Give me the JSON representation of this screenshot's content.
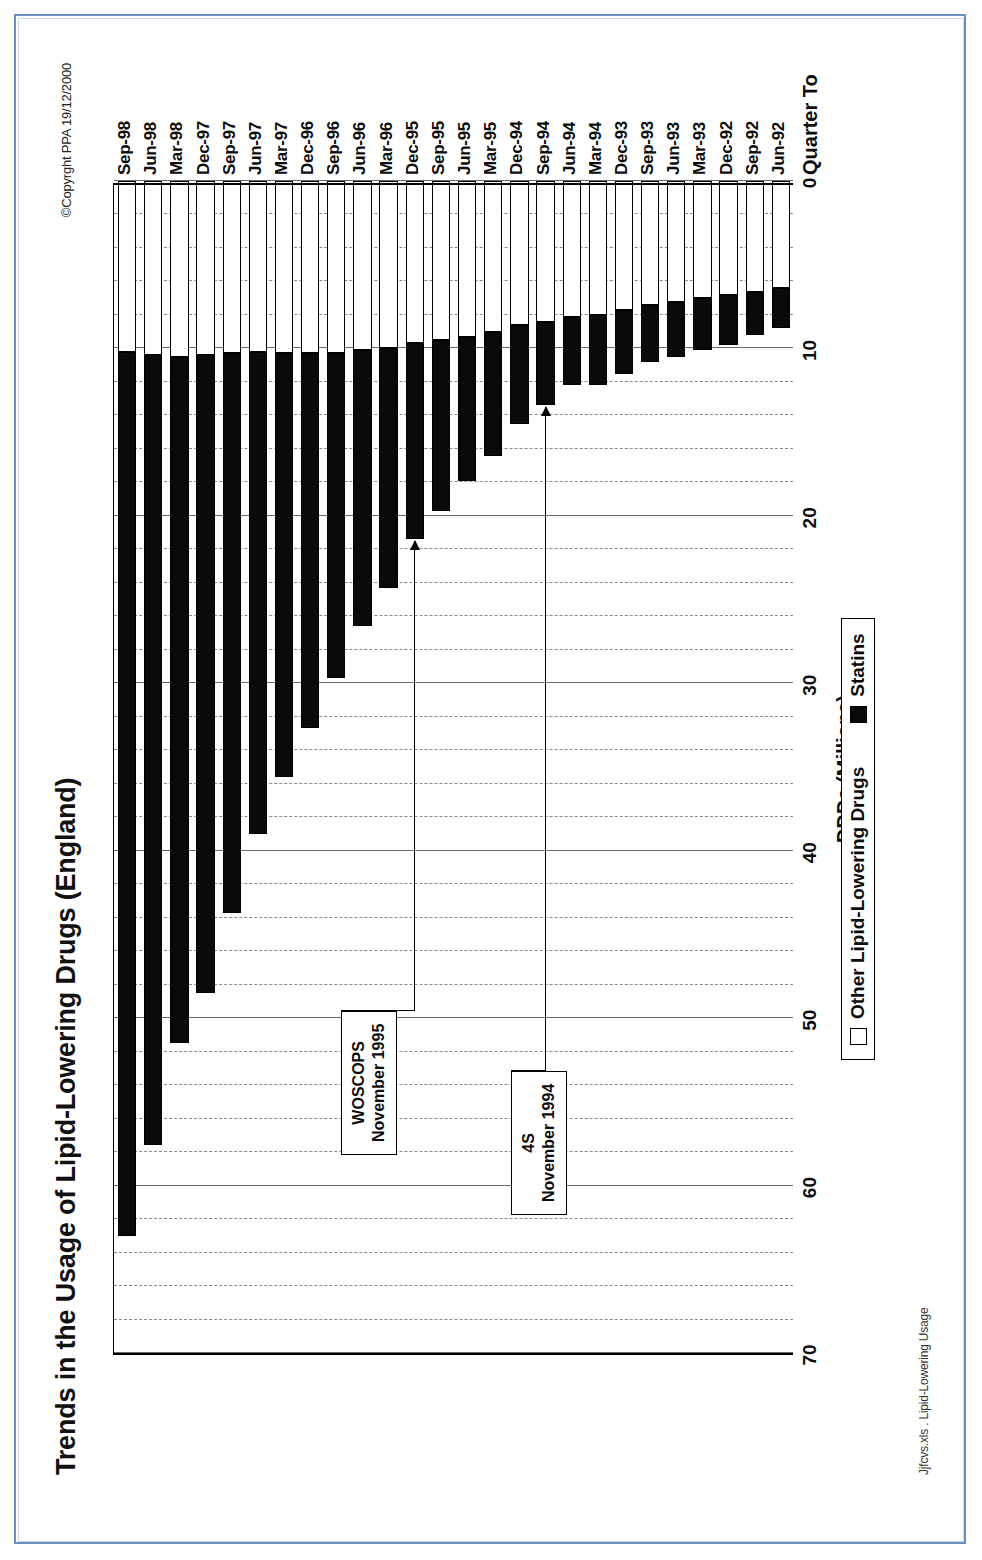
{
  "document": {
    "title": "Trends in the Usage of Lipid-Lowering Drugs (England)",
    "copyright": "©Copyrght PPA 19/12/2000",
    "filename": "Jjfcvs.xls . Lipid-Lowering Usage"
  },
  "legend": {
    "other_label": "Other Lipid-Lowering Drugs",
    "statins_label": "Statins"
  },
  "annotations": [
    {
      "id": "woscops",
      "line1": "WOSCOPS",
      "line2": "November 1995",
      "points_to": "Dec-95"
    },
    {
      "id": "4s",
      "line1": "4S",
      "line2": "November 1994",
      "points_to": "Sep-94"
    }
  ],
  "axes": {
    "value_title": "DDDs (Millions)",
    "category_title": "Quarter To",
    "value_ticks": [
      0,
      10,
      20,
      30,
      40,
      50,
      60,
      70
    ],
    "value_min": 0,
    "value_max": 70,
    "value_reversed": true,
    "minor_ticks_per_major": 5
  },
  "colors": {
    "statins": "#0a0a0a",
    "other": "#ffffff",
    "axis": "#000000",
    "grid": "#8a8a8a",
    "page_border": "#6d8fc0"
  },
  "chart_data": {
    "type": "bar",
    "orientation": "horizontal-stacked",
    "title": "Trends in the Usage of Lipid-Lowering Drugs (England)",
    "xlabel": "DDDs (Millions)",
    "ylabel": "Quarter To",
    "xlim": [
      0,
      70
    ],
    "x_reversed": true,
    "grid": true,
    "legend_position": "bottom",
    "categories": [
      "Sep-98",
      "Jun-98",
      "Mar-98",
      "Dec-97",
      "Sep-97",
      "Jun-97",
      "Mar-97",
      "Dec-96",
      "Sep-96",
      "Jun-96",
      "Mar-96",
      "Dec-95",
      "Sep-95",
      "Jun-95",
      "Mar-95",
      "Dec-94",
      "Sep-94",
      "Jun-94",
      "Mar-94",
      "Dec-93",
      "Sep-93",
      "Jun-93",
      "Mar-93",
      "Dec-92",
      "Sep-92",
      "Jun-92"
    ],
    "series": [
      {
        "name": "Other Lipid-Lowering Drugs",
        "values": [
          10.2,
          10.4,
          10.5,
          10.4,
          10.3,
          10.2,
          10.3,
          10.3,
          10.3,
          10.1,
          10.0,
          9.7,
          9.5,
          9.3,
          9.0,
          8.6,
          8.4,
          8.1,
          8.0,
          7.7,
          7.4,
          7.2,
          7.0,
          6.8,
          6.6,
          6.4
        ]
      },
      {
        "name": "Statins",
        "values": [
          52.8,
          47.2,
          41.0,
          38.1,
          33.4,
          28.8,
          25.3,
          22.4,
          19.4,
          16.5,
          14.3,
          11.7,
          10.2,
          8.6,
          7.4,
          5.9,
          5.0,
          4.1,
          4.2,
          3.8,
          3.4,
          3.3,
          3.1,
          3.0,
          2.6,
          2.4
        ]
      }
    ],
    "totals": [
      63.0,
      57.6,
      51.5,
      48.5,
      43.7,
      39.0,
      35.6,
      32.7,
      29.7,
      26.6,
      24.3,
      21.4,
      19.7,
      17.9,
      16.4,
      14.5,
      13.4,
      12.2,
      12.2,
      11.5,
      10.8,
      10.5,
      10.1,
      9.8,
      9.2,
      8.8
    ]
  }
}
